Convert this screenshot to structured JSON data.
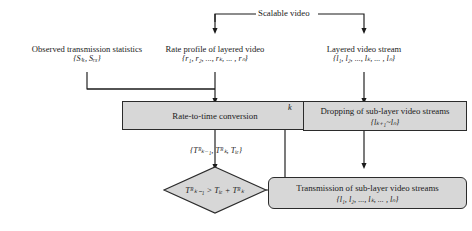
{
  "diagram": {
    "title_source": "Scalable video",
    "inputs": {
      "observed": {
        "line1": "Observed transmission statistics",
        "line2": "{Sₜₓ, Sᵣₓ}"
      },
      "rate_profile": {
        "line1": "Rate profile of layered video",
        "line2": "{r₁, r₂, ..., rₖ, ... , rₙ}"
      },
      "layered_stream": {
        "line1": "Layered video stream",
        "line2": "{l₁, l₂, ..., lₖ, ... , lₙ}"
      }
    },
    "nodes": {
      "rate_to_time": {
        "text": "Rate-to-time conversion"
      },
      "dropping": {
        "line1": "Dropping of sub-layer video streams",
        "line2": "{lₖ₊₁~lₙ}"
      },
      "transmission": {
        "line1": "Transmission of sub-layer video streams",
        "line2": "{l₁, l₂, ..., lₖ, ... , lₙ}"
      }
    },
    "decision": {
      "condition": "Tᴿₖ₋₁ > Tᵢₑ + Tᴿₖ"
    },
    "edge_labels": {
      "timing_tuple": "{Tᴿₖ₋₁, Tᴿₖ, Tᵢₑ}",
      "k": "k"
    },
    "colors": {
      "fill": "#d7d7d7",
      "stroke": "#2b2b2b",
      "text": "#1a1a1a"
    }
  }
}
